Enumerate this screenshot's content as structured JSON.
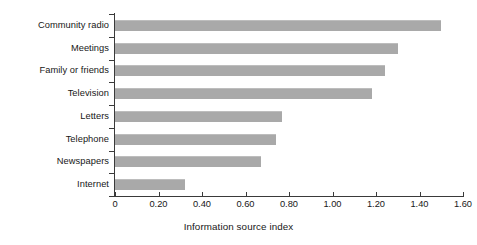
{
  "chart_data": {
    "type": "bar",
    "orientation": "horizontal",
    "title": "",
    "subtitle": "",
    "xlabel": "Information source index",
    "ylabel": "",
    "categories": [
      "Community radio",
      "Meetings",
      "Family or friends",
      "Television",
      "Letters",
      "Telephone",
      "Newspapers",
      "Internet"
    ],
    "values": [
      1.5,
      1.3,
      1.24,
      1.18,
      0.77,
      0.74,
      0.67,
      0.32
    ],
    "series": [
      {
        "name": "Information source index",
        "values": [
          1.5,
          1.3,
          1.24,
          1.18,
          0.77,
          0.74,
          0.67,
          0.32
        ]
      }
    ],
    "xlim": [
      0,
      1.6
    ],
    "xticks": [
      0,
      0.2,
      0.4,
      0.6,
      0.8,
      1.0,
      1.2,
      1.4,
      1.6
    ],
    "xtick_labels": [
      "0",
      "0.20",
      "0.40",
      "0.60",
      "0.80",
      "1.00",
      "1.20",
      "1.40",
      "1.60"
    ],
    "grid": false,
    "legend": false,
    "legend_position": "none",
    "bar_color": "#a9a9a9",
    "axis_color": "#3a3a3a",
    "text_color": "#171717",
    "background_color": "#ffffff"
  }
}
